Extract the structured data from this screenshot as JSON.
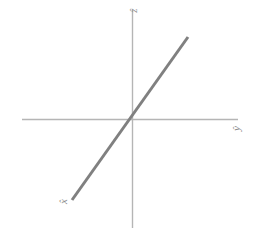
{
  "figure": {
    "width": 253,
    "height": 237,
    "background": "#ffffff"
  },
  "labels": {
    "z": "ẑ",
    "y": "ŷ",
    "x": "x̂"
  },
  "colors": {
    "axis": "#b5b5b5",
    "line": "#808080",
    "label": "#8c8c8c",
    "background": "#ffffff"
  },
  "chart_data": {
    "type": "line",
    "title": "",
    "xlabel": "ŷ",
    "ylabel": "ẑ",
    "annotations": [
      "x̂"
    ],
    "grid": false,
    "legend": null,
    "axes": {
      "origin_px": [
        132,
        119
      ],
      "horizontal_axis_px": {
        "x1": 22,
        "y1": 119,
        "x2": 238,
        "y2": 119
      },
      "vertical_axis_px": {
        "x1": 132,
        "y1": 10,
        "x2": 132,
        "y2": 228
      },
      "xlim": [
        -110,
        106
      ],
      "ylim": [
        -109,
        109
      ],
      "ticks": []
    },
    "series": [
      {
        "name": "x-axis-direction",
        "color": "#808080",
        "width_px": 3,
        "points_px": [
          [
            72,
            200
          ],
          [
            188,
            37
          ]
        ],
        "x": [
          -60,
          56
        ],
        "y": [
          -81,
          82
        ],
        "slope": 1.405
      }
    ]
  }
}
